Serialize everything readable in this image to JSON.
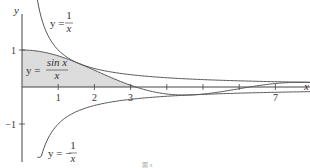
{
  "chart_data": {
    "type": "line",
    "title": "",
    "xlabel": "x",
    "ylabel": "y",
    "xlim": [
      0,
      8
    ],
    "ylim": [
      -1.9,
      2.4
    ],
    "grid": false,
    "x_ticks": [
      1,
      2,
      3,
      4,
      5,
      6,
      7
    ],
    "x_tick_labels": [
      "1",
      "2",
      "3",
      "",
      "",
      "",
      "7"
    ],
    "y_ticks": [
      1,
      -1
    ],
    "y_tick_labels": [
      "1",
      "−1"
    ],
    "series": [
      {
        "name": "y = 1/x",
        "function": "1/x",
        "x_range": [
          0.42,
          8
        ]
      },
      {
        "name": "y = sin x / x",
        "function": "sin(x)/x",
        "x_range": [
          0,
          8
        ],
        "shaded_area_to_axis": true,
        "x_shade_range": [
          0,
          3.14159
        ]
      },
      {
        "name": "y = −1/x",
        "function": "-1/x",
        "x_range": [
          0.42,
          8
        ]
      }
    ],
    "annotations": [
      {
        "text_prefix": "y =",
        "numerator": "1",
        "denominator": "x",
        "for": "y = 1/x"
      },
      {
        "text_prefix": "y =",
        "numerator": "sin x",
        "denominator": "x",
        "for": "y = sin x / x"
      },
      {
        "text_prefix": "y = −",
        "numerator": "1",
        "denominator": "x",
        "for": "y = −1/x"
      }
    ],
    "caption": "圖 x"
  },
  "colors": {
    "curve": "#555555",
    "axis": "#444444",
    "shade": "#dcdcdc"
  }
}
